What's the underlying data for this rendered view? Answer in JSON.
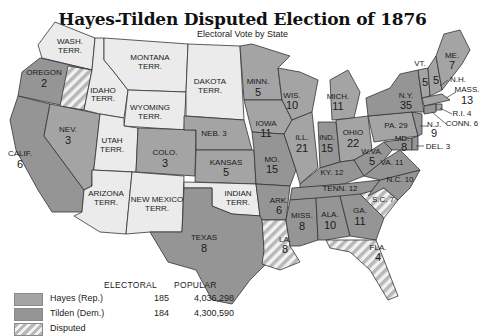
{
  "title": "Hayes-Tilden Disputed Election of 1876",
  "subtitle": "Electoral Vote by State",
  "colors": {
    "hayes": "#a4a4a4",
    "tilden": "#959595",
    "territory": "#ebebeb",
    "disputed_stripe": "#b8b8b8",
    "border": "#333333"
  },
  "legend": {
    "headers": {
      "electoral": "ELECTORAL",
      "popular": "POPULAR"
    },
    "rows": [
      {
        "name": "Hayes (Rep.)",
        "electoral": "185",
        "popular": "4,036,298"
      },
      {
        "name": "Tilden (Dem.)",
        "electoral": "184",
        "popular": "4,300,590"
      },
      {
        "name": "Disputed",
        "electoral": "",
        "popular": ""
      }
    ]
  },
  "regions": {
    "wash": {
      "name": "WASH.",
      "sub": "TERR."
    },
    "oregon": {
      "name": "OREGON",
      "votes": "2",
      "disputed_votes": "1"
    },
    "calif": {
      "name": "CALIF.",
      "votes": "6"
    },
    "nev": {
      "name": "NEV.",
      "votes": "3"
    },
    "idaho": {
      "name": "IDAHO",
      "sub": "TERR."
    },
    "montana": {
      "name": "MONTANA",
      "sub": "TERR."
    },
    "wyoming": {
      "name": "WYOMING",
      "sub": "TERR."
    },
    "utah": {
      "name": "UTAH",
      "sub": "TERR."
    },
    "colo": {
      "name": "COLO.",
      "votes": "3"
    },
    "arizona": {
      "name": "ARIZONA",
      "sub": "TERR."
    },
    "newmexico": {
      "name": "NEW MEXICO",
      "sub": "TERR."
    },
    "dakota": {
      "name": "DAKOTA",
      "sub": "TERR."
    },
    "neb": {
      "name": "NEB. 3"
    },
    "kansas": {
      "name": "KANSAS",
      "votes": "5"
    },
    "indian": {
      "name": "INDIAN",
      "sub": "TERR."
    },
    "texas": {
      "name": "TEXAS",
      "votes": "8"
    },
    "minn": {
      "name": "MINN.",
      "votes": "5"
    },
    "iowa": {
      "name": "IOWA",
      "votes": "11"
    },
    "mo": {
      "name": "MO.",
      "votes": "15"
    },
    "ark": {
      "name": "ARK.",
      "votes": "6"
    },
    "la": {
      "name": "LA.",
      "votes": "8"
    },
    "wis": {
      "name": "WIS.",
      "votes": "10"
    },
    "ill": {
      "name": "ILL.",
      "votes": "21"
    },
    "mich": {
      "name": "MICH.",
      "votes": "11"
    },
    "ind": {
      "name": "IND.",
      "votes": "15"
    },
    "ohio": {
      "name": "OHIO",
      "votes": "22"
    },
    "ky": {
      "name": "KY. 12"
    },
    "tenn": {
      "name": "TENN. 12"
    },
    "miss": {
      "name": "MISS.",
      "votes": "8"
    },
    "ala": {
      "name": "ALA.",
      "votes": "10"
    },
    "ga": {
      "name": "GA.",
      "votes": "11"
    },
    "fla": {
      "name": "FLA.",
      "votes": "4"
    },
    "sc": {
      "name": "S.C. 7"
    },
    "nc": {
      "name": "N.C. 10"
    },
    "va": {
      "name": "VA. 11"
    },
    "wva": {
      "name": "W.VA.",
      "votes": "5"
    },
    "pa": {
      "name": "PA. 29"
    },
    "md": {
      "name": "MD.",
      "votes": "8"
    },
    "del": {
      "name": "DEL. 3"
    },
    "nj": {
      "name": "N.J.",
      "votes": "9"
    },
    "ny": {
      "name": "N.Y.",
      "votes": "35"
    },
    "vt": {
      "name": "VT.",
      "votes": "5"
    },
    "nh": {
      "name": "N.H.",
      "votes": "5"
    },
    "me": {
      "name": "ME.",
      "votes": "7"
    },
    "mass": {
      "name": "MASS.",
      "votes": "13"
    },
    "ri": {
      "name": "R.I. 4"
    },
    "conn": {
      "name": "CONN. 6"
    }
  }
}
